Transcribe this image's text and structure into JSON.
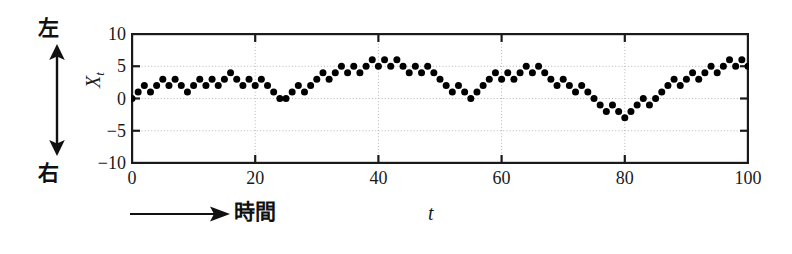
{
  "chart_data": {
    "type": "scatter",
    "title": "",
    "subtitle": "",
    "xlabel": "t",
    "ylabel": "X_t",
    "xlim": [
      0,
      100
    ],
    "ylim": [
      -10,
      10
    ],
    "xticks": [
      0,
      20,
      40,
      60,
      80,
      100
    ],
    "yticks": [
      10,
      5,
      0,
      -5,
      -10
    ],
    "grid": true,
    "grid_style": "dotted",
    "legend": null,
    "marker": "filled-circle",
    "marker_color": "#000000",
    "x": [
      0,
      1,
      2,
      3,
      4,
      5,
      6,
      7,
      8,
      9,
      10,
      11,
      12,
      13,
      14,
      15,
      16,
      17,
      18,
      19,
      20,
      21,
      22,
      23,
      24,
      25,
      26,
      27,
      28,
      29,
      30,
      31,
      32,
      33,
      34,
      35,
      36,
      37,
      38,
      39,
      40,
      41,
      42,
      43,
      44,
      45,
      46,
      47,
      48,
      49,
      50,
      51,
      52,
      53,
      54,
      55,
      56,
      57,
      58,
      59,
      60,
      61,
      62,
      63,
      64,
      65,
      66,
      67,
      68,
      69,
      70,
      71,
      72,
      73,
      74,
      75,
      76,
      77,
      78,
      79,
      80,
      81,
      82,
      83,
      84,
      85,
      86,
      87,
      88,
      89,
      90,
      91,
      92,
      93,
      94,
      95,
      96,
      97,
      98,
      99,
      100
    ],
    "values": [
      0,
      1,
      2,
      1,
      2,
      3,
      2,
      3,
      2,
      1,
      2,
      3,
      2,
      3,
      2,
      3,
      4,
      3,
      2,
      3,
      2,
      3,
      2,
      1,
      0,
      0,
      1,
      2,
      1,
      2,
      3,
      4,
      3,
      4,
      5,
      4,
      5,
      4,
      5,
      6,
      5,
      6,
      5,
      6,
      5,
      4,
      5,
      4,
      5,
      4,
      3,
      2,
      1,
      2,
      1,
      0,
      1,
      2,
      3,
      4,
      3,
      4,
      3,
      4,
      5,
      4,
      5,
      4,
      3,
      2,
      3,
      2,
      1,
      2,
      1,
      0,
      -1,
      -2,
      -1,
      -2,
      -3,
      -2,
      -1,
      0,
      -1,
      0,
      1,
      2,
      3,
      2,
      3,
      4,
      3,
      4,
      5,
      4,
      5,
      6,
      5,
      6,
      5
    ]
  },
  "annotations": {
    "direction_top": "左",
    "direction_bottom": "右",
    "time_label": "時間",
    "y_axis_symbol": "X",
    "y_axis_subscript": "t",
    "x_axis_symbol": "t"
  },
  "colors": {
    "marker": "#000000",
    "axis": "#1a1a1a",
    "grid": "#b4b4b4",
    "background": "#ffffff"
  }
}
